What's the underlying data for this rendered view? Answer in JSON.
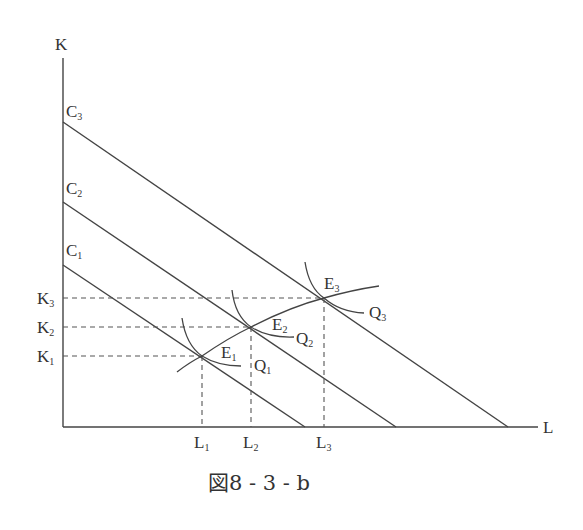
{
  "figure": {
    "caption": "図8 - 3 - b",
    "axes": {
      "y_label": "K",
      "x_label": "L"
    },
    "isocost_lines": [
      {
        "label": "C",
        "sub": "3"
      },
      {
        "label": "C",
        "sub": "2"
      },
      {
        "label": "C",
        "sub": "1"
      }
    ],
    "capital_levels": [
      {
        "label": "K",
        "sub": "3"
      },
      {
        "label": "K",
        "sub": "2"
      },
      {
        "label": "K",
        "sub": "1"
      }
    ],
    "labor_levels": [
      {
        "label": "L",
        "sub": "1"
      },
      {
        "label": "L",
        "sub": "2"
      },
      {
        "label": "L",
        "sub": "3"
      }
    ],
    "equilibria": [
      {
        "label": "E",
        "sub": "1"
      },
      {
        "label": "E",
        "sub": "2"
      },
      {
        "label": "E",
        "sub": "3"
      }
    ],
    "isoquants": [
      {
        "label": "Q",
        "sub": "1"
      },
      {
        "label": "Q",
        "sub": "2"
      },
      {
        "label": "Q",
        "sub": "3"
      }
    ]
  }
}
